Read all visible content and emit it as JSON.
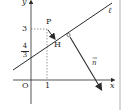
{
  "diagram": {
    "axes": {
      "x_label": "x",
      "y_label": "y",
      "origin_label": "O"
    },
    "ticks": {
      "x_tick": "1",
      "y_tick": "3",
      "y_intercept": {
        "numerator": "4",
        "denominator": "3"
      }
    },
    "points": {
      "P": "P",
      "H": "H"
    },
    "line_label": "ℓ",
    "vector_label": "n",
    "colors": {
      "ink": "#2a2a2a",
      "dashed": "#555555",
      "background": "#ffffff",
      "border": "#d8d8d8"
    }
  }
}
